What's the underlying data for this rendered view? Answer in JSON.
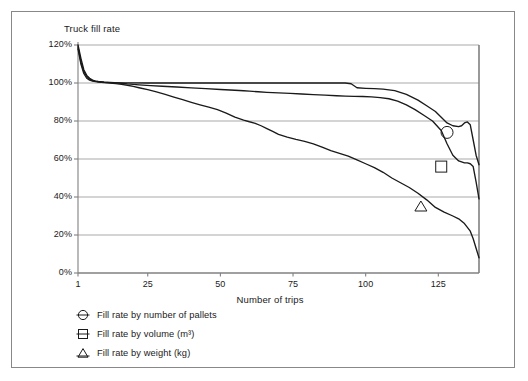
{
  "figure": {
    "title": "Truck fill rate",
    "frame_color": "#888888",
    "axis_color": "#808080",
    "grid_color": "#9a9a9a",
    "series_color": "#1a1a1a"
  },
  "chart_data": {
    "type": "line",
    "title": "Truck fill rate",
    "xlabel": "Number of trips",
    "ylabel": "Truck fill rate",
    "xlim": [
      1,
      139
    ],
    "ylim": [
      0,
      120
    ],
    "xticks": [
      1,
      25,
      50,
      75,
      100,
      125
    ],
    "xticklabels": [
      "1",
      "25",
      "50",
      "75",
      "100",
      "125"
    ],
    "yticks": [
      0,
      20,
      40,
      60,
      80,
      100,
      120
    ],
    "yticklabels": [
      "0%",
      "20%",
      "40%",
      "60%",
      "80%",
      "100%",
      "120%"
    ],
    "grid": "horizontal",
    "legend_position": "below-axes-left",
    "y_unit": "percent",
    "series": [
      {
        "name": "Fill rate by number of pallets",
        "marker": "circle-with-line",
        "marker_point": {
          "x": 128,
          "y": 74
        },
        "x": [
          1,
          2,
          3,
          4,
          5,
          6,
          7,
          8,
          10,
          12,
          15,
          20,
          25,
          30,
          35,
          40,
          45,
          50,
          55,
          60,
          65,
          70,
          75,
          80,
          85,
          90,
          93,
          95,
          97,
          100,
          103,
          106,
          110,
          114,
          118,
          121,
          124,
          126,
          128,
          130,
          132,
          133,
          134,
          135,
          136,
          137,
          138,
          139
        ],
        "y": [
          120,
          113,
          107,
          104,
          102.5,
          101.5,
          101,
          100.7,
          100.4,
          100.2,
          100.1,
          100.1,
          100,
          100,
          100,
          100,
          100,
          100,
          100,
          100,
          100,
          100,
          100,
          100,
          100,
          100,
          100,
          99.6,
          97.5,
          97.2,
          97,
          96.8,
          96,
          94,
          91,
          88,
          85,
          82,
          79,
          77.5,
          77,
          77.5,
          79,
          79.5,
          78,
          70,
          62,
          57
        ]
      },
      {
        "name": "Fill rate by volume (m³)",
        "marker": "square-with-line",
        "marker_point": {
          "x": 126,
          "y": 56
        },
        "x": [
          1,
          2,
          3,
          4,
          5,
          6,
          7,
          8,
          10,
          12,
          15,
          18,
          22,
          26,
          30,
          35,
          40,
          45,
          50,
          55,
          58,
          60,
          63,
          66,
          70,
          74,
          78,
          82,
          86,
          90,
          93,
          96,
          99,
          102,
          105,
          108,
          111,
          114,
          117,
          120,
          123,
          126,
          128,
          130,
          132,
          134,
          135,
          136,
          137,
          138,
          139
        ],
        "y": [
          119,
          111,
          106,
          103.5,
          102,
          101.3,
          101,
          100.8,
          100.5,
          100.3,
          100,
          99.5,
          99,
          98.6,
          98.3,
          97.9,
          97.4,
          97,
          96.6,
          96.2,
          95.9,
          95.7,
          95.4,
          95.1,
          94.8,
          94.5,
          94.2,
          93.9,
          93.6,
          93.3,
          93.1,
          93,
          92.9,
          92.7,
          92.3,
          91.7,
          90.5,
          88.5,
          86,
          83,
          80,
          75,
          68,
          62,
          59,
          58,
          58,
          57.5,
          56,
          48,
          39
        ]
      },
      {
        "name": "Fill rate by weight (kg)",
        "marker": "triangle-with-line",
        "marker_point": {
          "x": 119,
          "y": 35
        },
        "x": [
          1,
          2,
          3,
          4,
          5,
          6,
          7,
          8,
          10,
          12,
          14,
          16,
          18,
          20,
          22,
          25,
          28,
          31,
          34,
          37,
          40,
          43,
          46,
          49,
          52,
          55,
          58,
          60,
          62,
          64,
          66,
          68,
          70,
          73,
          76,
          79,
          82,
          85,
          88,
          91,
          94,
          97,
          100,
          103,
          106,
          109,
          112,
          115,
          118,
          121,
          124,
          127,
          130,
          132,
          134,
          136,
          137,
          138,
          139
        ],
        "y": [
          118,
          110,
          105,
          102.5,
          101.5,
          101,
          100.7,
          100.5,
          100.2,
          100,
          99.7,
          99.3,
          98.8,
          98.2,
          97.5,
          96.5,
          95.3,
          94,
          92.6,
          91.2,
          89.8,
          88.5,
          87.3,
          86,
          84.2,
          82,
          80.5,
          79.6,
          78.8,
          77.5,
          76,
          74.5,
          73,
          71.5,
          70.3,
          69.3,
          68,
          66.2,
          64.4,
          63,
          61.5,
          59.5,
          57.5,
          55.5,
          53,
          50,
          47.5,
          45,
          42,
          38.5,
          34.5,
          32,
          30,
          28.5,
          26,
          22,
          18,
          13,
          8
        ]
      }
    ]
  },
  "axes": {
    "y_tick_labels": [
      "120%",
      "100%",
      "80%",
      "60%",
      "40%",
      "20%",
      "0%"
    ],
    "x_tick_labels": [
      "1",
      "25",
      "50",
      "75",
      "100",
      "125"
    ],
    "x_axis_title": "Number of trips"
  },
  "legend": {
    "items": [
      {
        "label": "Fill rate by number of pallets",
        "marker": "circle-with-line"
      },
      {
        "label": "Fill rate by volume (m³)",
        "marker": "square-with-line"
      },
      {
        "label": "Fill rate by weight (kg)",
        "marker": "triangle-with-line"
      }
    ]
  }
}
